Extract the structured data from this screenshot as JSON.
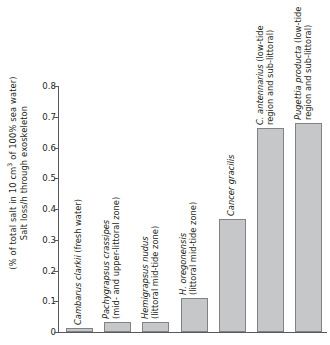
{
  "axis": {
    "ylabel_line1": "Salt loss/h through exoskeleton",
    "ylabel_line2_a": "(% of total salt in 10 cm",
    "ylabel_line2_sup": "3",
    "ylabel_line2_b": " of 100% sea water)",
    "yticks": [
      "0.8",
      "0.7",
      "0.6",
      "0.5",
      "0.4",
      "0.3",
      "0.2",
      "0.1",
      "0"
    ]
  },
  "chart_data": {
    "type": "bar",
    "title": "",
    "xlabel": "",
    "ylabel": "Salt loss/h through exoskeleton (% of total salt in 10 cm3 of 100% sea water)",
    "ylim": [
      0,
      0.8
    ],
    "ytick_values": [
      0.8,
      0.7,
      0.6,
      0.5,
      0.4,
      0.3,
      0.2,
      0.1,
      0
    ],
    "grid": false,
    "legend": "none",
    "bar_fill_color": "#c6c7c8",
    "bar_edge_color": "#808285",
    "axis_color": "#58595b",
    "categories": [
      "Cambarus clarkii (fresh water)",
      "Pachygrapsus crassipes (mid- and upper-littoral zone)",
      "Hemigrapsus nudus (littoral mid-tide zone)",
      "H. oregonensis (littoral mid-tide zone)",
      "Cancer gracilis",
      "C. antennarius (low-tide region and sub-littoral)",
      "Pugettia producta (low-tide region and sub-littoral)"
    ],
    "values": [
      0.012,
      0.033,
      0.032,
      0.112,
      0.368,
      0.665,
      0.68
    ],
    "bars": [
      {
        "species": "Cambarus clarkii",
        "habitat": "(fresh water)",
        "label_lines": [
          "Cambarus clarkii (fresh water)"
        ],
        "value": 0.012
      },
      {
        "species": "Pachygrapsus crassipes",
        "habitat": "(mid- and upper-littoral zone)",
        "label_lines": [
          "Pachygrapsus crassipes",
          "(mid- and upper-littoral zone)"
        ],
        "value": 0.033
      },
      {
        "species": "Hemigrapsus nudus",
        "habitat": "(littoral mid-tide zone)",
        "label_lines": [
          "Hemigrapsus nudus",
          "(littoral mid-tide zone)"
        ],
        "value": 0.032
      },
      {
        "species": "H. oregonensis",
        "habitat": "(littoral mid-tide zone)",
        "label_lines": [
          "H. oregonensis",
          "(littoral mid-tide zone)"
        ],
        "value": 0.112
      },
      {
        "species": "Cancer gracilis",
        "habitat": "",
        "label_lines": [
          "Cancer gracilis"
        ],
        "value": 0.368
      },
      {
        "species": "C. antennarius",
        "habitat": "(low-tide region and sub-littoral)",
        "label_lines": [
          "C. antennarius (low-tide",
          "region and sub-littoral)"
        ],
        "value": 0.665
      },
      {
        "species": "Pugettia producta",
        "habitat": "(low-tide region and sub-littoral)",
        "label_lines": [
          "Pugettia producta (low-tide",
          "region and sub-littoral)"
        ],
        "value": 0.68
      }
    ]
  }
}
